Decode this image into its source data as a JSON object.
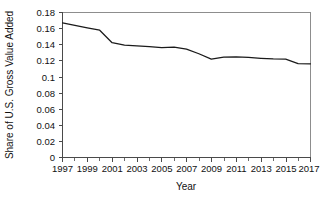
{
  "chart_data": {
    "type": "line",
    "title": "",
    "xlabel": "Year",
    "ylabel": "Share of U.S. Gross Value Added",
    "xlim": [
      1997,
      2017
    ],
    "ylim": [
      0,
      0.18
    ],
    "grid": false,
    "legend": false,
    "x_tick_labels": [
      "1997",
      "1999",
      "2001",
      "2003",
      "2005",
      "2007",
      "2009",
      "2011",
      "2013",
      "2015",
      "2017"
    ],
    "x_tick_values": [
      1997,
      1999,
      2001,
      2003,
      2005,
      2007,
      2009,
      2011,
      2013,
      2015,
      2017
    ],
    "x_minor_tick_values": [
      1998,
      2000,
      2002,
      2004,
      2006,
      2008,
      2010,
      2012,
      2014,
      2016
    ],
    "y_tick_labels": [
      "0.18",
      "0.16",
      "0.14",
      "0.12",
      "0.1",
      "0.08",
      "0.06",
      "0.04",
      "0.02",
      "0"
    ],
    "y_tick_values": [
      0.18,
      0.16,
      0.14,
      0.12,
      0.1,
      0.08,
      0.06,
      0.04,
      0.02,
      0
    ],
    "x": [
      1997,
      1998,
      1999,
      2000,
      2001,
      2002,
      2003,
      2004,
      2005,
      2006,
      2007,
      2008,
      2009,
      2010,
      2011,
      2012,
      2013,
      2014,
      2015,
      2016,
      2017
    ],
    "values": [
      0.167,
      0.164,
      0.161,
      0.158,
      0.1425,
      0.1395,
      0.1385,
      0.1375,
      0.1365,
      0.137,
      0.1345,
      0.1288,
      0.1222,
      0.1245,
      0.1248,
      0.1242,
      0.1232,
      0.1225,
      0.1222,
      0.1165,
      0.1163
    ],
    "series": [
      {
        "name": "Share of U.S. Gross Value Added",
        "color": "#1a1a1a",
        "values": [
          0.167,
          0.164,
          0.161,
          0.158,
          0.1425,
          0.1395,
          0.1385,
          0.1375,
          0.1365,
          0.137,
          0.1345,
          0.1288,
          0.1222,
          0.1245,
          0.1248,
          0.1242,
          0.1232,
          0.1225,
          0.1222,
          0.1165,
          0.1163
        ]
      }
    ]
  },
  "colors": {
    "series": "#1a1a1a",
    "axis": "#4a4a4a",
    "frame": "#8d8d8d",
    "background": "#ffffff",
    "text": "#111111"
  }
}
